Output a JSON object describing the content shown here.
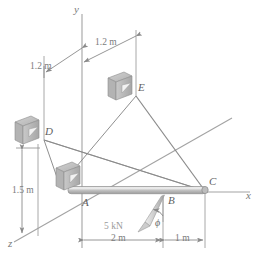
{
  "figure": {
    "background_color": "#ffffff",
    "line_color": "#8c8c8c",
    "body_color": "#b9b9b9",
    "text_color": "#6d6d6d"
  },
  "axes": [
    {
      "name": "y-axis",
      "label": "y",
      "direction": "vertical-up"
    },
    {
      "name": "x-axis",
      "label": "x",
      "direction": "horizontal-right"
    },
    {
      "name": "z-axis",
      "label": "z",
      "direction": "diagonal-down-left"
    }
  ],
  "points": [
    {
      "id": "A",
      "label": "A",
      "role": "support-bracket-origin"
    },
    {
      "id": "B",
      "label": "B",
      "role": "load-application-point"
    },
    {
      "id": "C",
      "label": "C",
      "role": "beam-free-end-on-x-axis"
    },
    {
      "id": "D",
      "label": "D",
      "role": "cable-anchor-bracket"
    },
    {
      "id": "E",
      "label": "E",
      "role": "cable-anchor-bracket"
    }
  ],
  "dimensions": [
    {
      "id": "d-to-y",
      "label": "1.2 m",
      "orientation": "diagonal",
      "description": "from D vertical guide to y-axis"
    },
    {
      "id": "y-to-e",
      "label": "1.2 m",
      "orientation": "diagonal",
      "description": "from y-axis to E vertical guide"
    },
    {
      "id": "height-a-to-d",
      "label": "1.5 m",
      "orientation": "vertical",
      "description": "vertical height of D above z-axis level"
    },
    {
      "id": "a-to-b",
      "label": "2 m",
      "orientation": "horizontal",
      "description": "along beam from A to B"
    },
    {
      "id": "b-to-c",
      "label": "1 m",
      "orientation": "horizontal",
      "description": "along beam from B to C"
    }
  ],
  "load": {
    "name": "applied-force",
    "magnitude_label": "5 kN",
    "angle_label": "ϕ",
    "applied_at": "B",
    "direction": "down-and-to-the-left"
  },
  "members": [
    {
      "name": "beam-AC",
      "from": "A",
      "to": "C",
      "type": "rigid-rod"
    },
    {
      "name": "cable-DC",
      "from": "D",
      "to": "C",
      "type": "cable"
    },
    {
      "name": "cable-EC",
      "from": "E",
      "to": "C",
      "type": "cable"
    }
  ],
  "supports": [
    {
      "name": "bracket-A",
      "at": "A"
    },
    {
      "name": "bracket-D",
      "at": "D"
    },
    {
      "name": "bracket-E",
      "at": "E"
    }
  ]
}
